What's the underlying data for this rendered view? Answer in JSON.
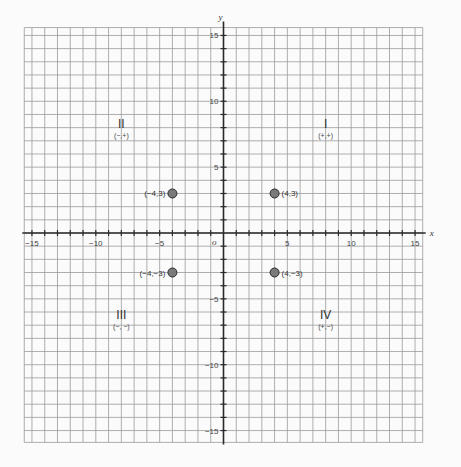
{
  "chart_data": {
    "type": "scatter",
    "title": "",
    "xlabel": "x",
    "ylabel": "y",
    "origin_label": "o",
    "xlim": [
      -15.6,
      15.6
    ],
    "ylim": [
      -15.9,
      15.6
    ],
    "grid": true,
    "x_ticks": [
      -15,
      -10,
      -5,
      5,
      10,
      15
    ],
    "y_ticks": [
      15,
      10,
      5,
      -5,
      -10,
      -15
    ],
    "x_tick_labels": [
      "−15",
      "−10",
      "−5",
      "5",
      "10",
      "15"
    ],
    "y_tick_labels": [
      "15",
      "10",
      "5",
      "−5",
      "−10",
      "−15"
    ],
    "points": [
      {
        "x": -4,
        "y": 3,
        "label": "(−4,3)"
      },
      {
        "x": 4,
        "y": 3,
        "label": "(4,3)"
      },
      {
        "x": -4,
        "y": -3,
        "label": "(−4,−3)"
      },
      {
        "x": 4,
        "y": -3,
        "label": "(4,−3)"
      }
    ],
    "quadrants": [
      {
        "numeral": "I",
        "signs": "(+,+)",
        "x": 8,
        "y": 8
      },
      {
        "numeral": "II",
        "signs": "(−,+)",
        "x": -8,
        "y": 8
      },
      {
        "numeral": "III",
        "signs": "(−, −)",
        "x": -8,
        "y": -6.5
      },
      {
        "numeral": "IV",
        "signs": "(+,−)",
        "x": 8,
        "y": -6.5
      }
    ],
    "colors": {
      "grid": "#9a9a9a",
      "axis": "#2a2a2a",
      "point_fill": "#7a7a7a",
      "point_stroke": "#2a2a2a",
      "background": "#fbfbfb"
    }
  }
}
